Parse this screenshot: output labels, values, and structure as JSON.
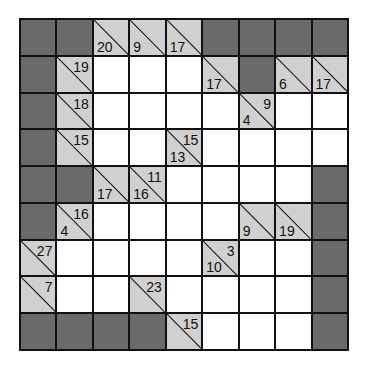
{
  "puzzle": {
    "type": "kakuro",
    "rows": 9,
    "cols": 9,
    "colors": {
      "block": "#6a6a6a",
      "clue": "#d0d0d0",
      "white": "#ffffff",
      "line": "#111111"
    },
    "grid": [
      [
        {
          "t": "B"
        },
        {
          "t": "B"
        },
        {
          "t": "C",
          "down": "20",
          "right": ""
        },
        {
          "t": "C",
          "down": "9",
          "right": ""
        },
        {
          "t": "C",
          "down": "17",
          "right": ""
        },
        {
          "t": "B"
        },
        {
          "t": "B"
        },
        {
          "t": "B"
        },
        {
          "t": "B"
        }
      ],
      [
        {
          "t": "B"
        },
        {
          "t": "C",
          "down": "",
          "right": "19"
        },
        {
          "t": "W"
        },
        {
          "t": "W"
        },
        {
          "t": "W"
        },
        {
          "t": "C",
          "down": "17",
          "right": ""
        },
        {
          "t": "B"
        },
        {
          "t": "C",
          "down": "6",
          "right": ""
        },
        {
          "t": "C",
          "down": "17",
          "right": ""
        }
      ],
      [
        {
          "t": "B"
        },
        {
          "t": "C",
          "down": "",
          "right": "18"
        },
        {
          "t": "W"
        },
        {
          "t": "W"
        },
        {
          "t": "W"
        },
        {
          "t": "W"
        },
        {
          "t": "C",
          "down": "4",
          "right": "9"
        },
        {
          "t": "W"
        },
        {
          "t": "W"
        }
      ],
      [
        {
          "t": "B"
        },
        {
          "t": "C",
          "down": "",
          "right": "15"
        },
        {
          "t": "W"
        },
        {
          "t": "W"
        },
        {
          "t": "C",
          "down": "13",
          "right": "15"
        },
        {
          "t": "W"
        },
        {
          "t": "W"
        },
        {
          "t": "W"
        },
        {
          "t": "W"
        }
      ],
      [
        {
          "t": "B"
        },
        {
          "t": "B"
        },
        {
          "t": "C",
          "down": "17",
          "right": ""
        },
        {
          "t": "C",
          "down": "16",
          "right": "11"
        },
        {
          "t": "W"
        },
        {
          "t": "W"
        },
        {
          "t": "W"
        },
        {
          "t": "W"
        },
        {
          "t": "B"
        }
      ],
      [
        {
          "t": "B"
        },
        {
          "t": "C",
          "down": "4",
          "right": "16"
        },
        {
          "t": "W"
        },
        {
          "t": "W"
        },
        {
          "t": "W"
        },
        {
          "t": "W"
        },
        {
          "t": "C",
          "down": "9",
          "right": ""
        },
        {
          "t": "C",
          "down": "19",
          "right": ""
        },
        {
          "t": "B"
        }
      ],
      [
        {
          "t": "C",
          "down": "",
          "right": "27"
        },
        {
          "t": "W"
        },
        {
          "t": "W"
        },
        {
          "t": "W"
        },
        {
          "t": "W"
        },
        {
          "t": "C",
          "down": "10",
          "right": "3"
        },
        {
          "t": "W"
        },
        {
          "t": "W"
        },
        {
          "t": "B"
        }
      ],
      [
        {
          "t": "C",
          "down": "",
          "right": "7"
        },
        {
          "t": "W"
        },
        {
          "t": "W"
        },
        {
          "t": "C",
          "down": "",
          "right": "23"
        },
        {
          "t": "W"
        },
        {
          "t": "W"
        },
        {
          "t": "W"
        },
        {
          "t": "W"
        },
        {
          "t": "B"
        }
      ],
      [
        {
          "t": "B"
        },
        {
          "t": "B"
        },
        {
          "t": "B"
        },
        {
          "t": "B"
        },
        {
          "t": "C",
          "down": "",
          "right": "15"
        },
        {
          "t": "W"
        },
        {
          "t": "W"
        },
        {
          "t": "W"
        },
        {
          "t": "B"
        }
      ]
    ]
  }
}
